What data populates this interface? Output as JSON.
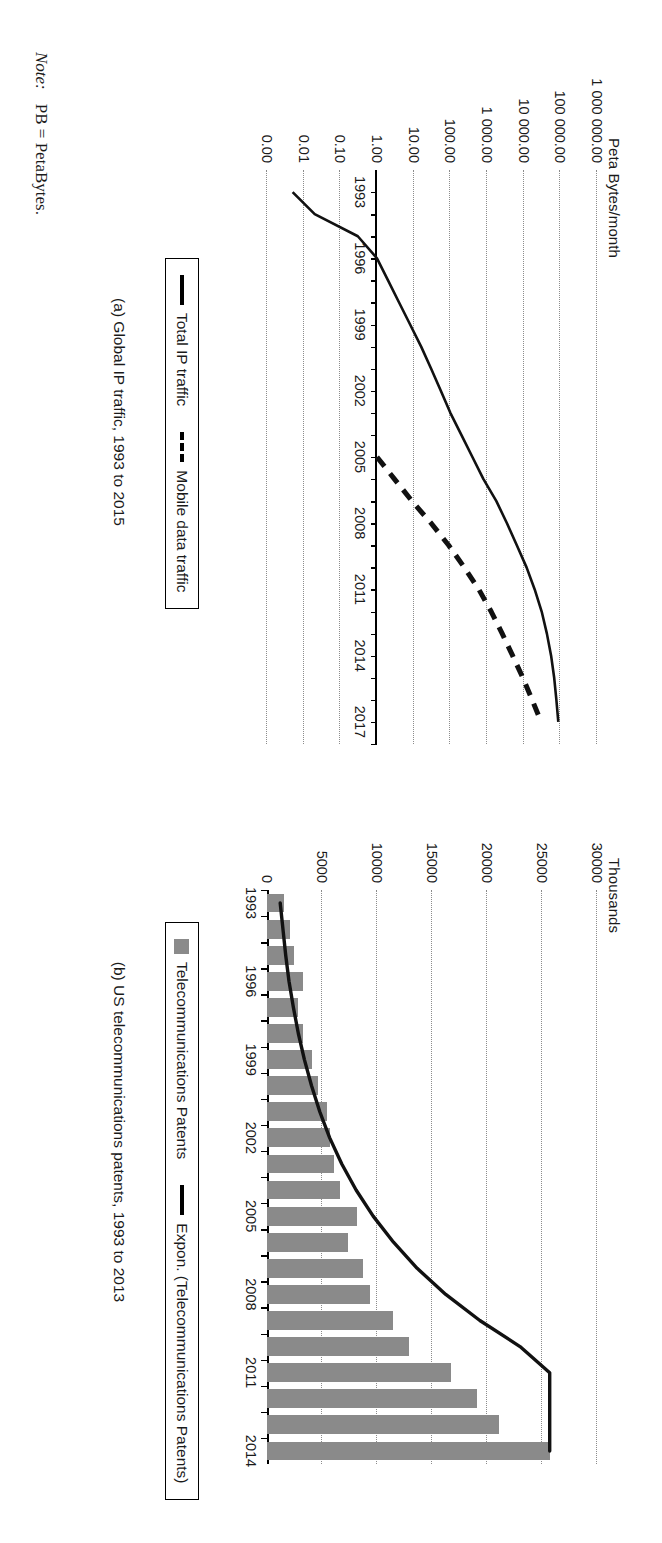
{
  "figure": {
    "note_label": "Note:",
    "note_text": "PB = PetaBytes."
  },
  "panel_a": {
    "caption": "(a) Global IP traffic, 1993 to 2015",
    "axis_title": "Peta Bytes/month",
    "y_ticks": [
      "1 000 000.00",
      "100 000.00",
      "10 000.00",
      "1 000.00",
      "100.00",
      "10.00",
      "1.00",
      "0.10",
      "0.01",
      "0.00"
    ],
    "x_ticks": [
      "1993",
      "1996",
      "1999",
      "2002",
      "2005",
      "2008",
      "2011",
      "2014",
      "2017"
    ],
    "legend": [
      {
        "label": "Total IP traffic",
        "style": "solid"
      },
      {
        "label": "Mobile data traffic",
        "style": "dashed"
      }
    ]
  },
  "panel_b": {
    "caption": "(b) US telecommunications patents, 1993 to 2013",
    "axis_title": "Thousands",
    "y_ticks": [
      "30000",
      "25000",
      "20000",
      "15000",
      "10000",
      "5000",
      "0"
    ],
    "x_ticks": [
      "1993",
      "1996",
      "1999",
      "2002",
      "2005",
      "2008",
      "2011",
      "2014"
    ],
    "legend": [
      {
        "label": "Telecommunications Patents",
        "style": "bar"
      },
      {
        "label": "Expon. (Telecommunications Patents)",
        "style": "solid"
      }
    ]
  },
  "chart_data": [
    {
      "type": "line",
      "panel": "a",
      "title": "(a) Global IP traffic, 1993 to 2015",
      "xlabel": "",
      "ylabel": "Peta Bytes/month",
      "yscale": "log",
      "ylim": [
        0.001,
        1000000
      ],
      "ytick_values": [
        1000000,
        100000,
        10000,
        1000,
        100,
        10,
        1,
        0.1,
        0.01,
        0.001
      ],
      "ytick_labels": [
        "1 000 000.00",
        "100 000.00",
        "10 000.00",
        "1 000.00",
        "100.00",
        "10.00",
        "1.00",
        "0.10",
        "0.01",
        "0.00"
      ],
      "xlim": [
        1992,
        2018
      ],
      "xtick_labels": [
        "1993",
        "1996",
        "1999",
        "2002",
        "2005",
        "2008",
        "2011",
        "2014",
        "2017"
      ],
      "grid": true,
      "legend_position": "below",
      "series": [
        {
          "name": "Total IP traffic",
          "style": "solid",
          "x": [
            1993,
            1994,
            1995,
            1996,
            1997,
            1998,
            1999,
            2000,
            2001,
            2002,
            2003,
            2004,
            2005,
            2006,
            2007,
            2008,
            2009,
            2010,
            2011,
            2012,
            2013,
            2014,
            2015,
            2016,
            2017
          ],
          "y": [
            0.005,
            0.02,
            0.3,
            1.0,
            2.0,
            4.0,
            8.0,
            16,
            30,
            55,
            100,
            200,
            400,
            800,
            1800,
            3500,
            6500,
            12000,
            20000,
            31000,
            43000,
            56000,
            68000,
            78000,
            88000
          ]
        },
        {
          "name": "Mobile data traffic",
          "style": "dashed",
          "x": [
            2005,
            2006,
            2007,
            2008,
            2009,
            2010,
            2011,
            2012,
            2013,
            2014,
            2015,
            2016,
            2017
          ],
          "y": [
            1.0,
            3.0,
            9.0,
            30,
            90,
            240,
            600,
            1300,
            2600,
            5000,
            9500,
            17000,
            30000
          ]
        }
      ]
    },
    {
      "type": "bar",
      "panel": "b",
      "title": "(b) US telecommunications patents, 1993 to 2013",
      "xlabel": "",
      "ylabel": "Thousands",
      "ylim": [
        0,
        30000
      ],
      "ytick_values": [
        0,
        5000,
        10000,
        15000,
        20000,
        25000,
        30000
      ],
      "grid": true,
      "legend_position": "below",
      "categories": [
        "1993",
        "1994",
        "1995",
        "1996",
        "1997",
        "1998",
        "1999",
        "2000",
        "2001",
        "2002",
        "2003",
        "2004",
        "2005",
        "2006",
        "2007",
        "2008",
        "2009",
        "2010",
        "2011",
        "2012",
        "2013",
        "2014"
      ],
      "series": [
        {
          "name": "Telecommunications Patents",
          "type": "bar",
          "values": [
            1550,
            2100,
            2500,
            3300,
            2800,
            3300,
            4100,
            4600,
            5500,
            5700,
            6100,
            6600,
            8200,
            7400,
            8700,
            9400,
            11500,
            12900,
            16700,
            19100,
            21100,
            25700
          ]
        },
        {
          "name": "Expon. (Telecommunications Patents)",
          "type": "line",
          "values": [
            1200,
            1450,
            1700,
            2000,
            2400,
            2850,
            3400,
            4050,
            4800,
            5700,
            6800,
            8100,
            9650,
            11500,
            13650,
            16250,
            19350,
            23000,
            25700,
            null,
            null,
            null
          ]
        }
      ]
    }
  ]
}
